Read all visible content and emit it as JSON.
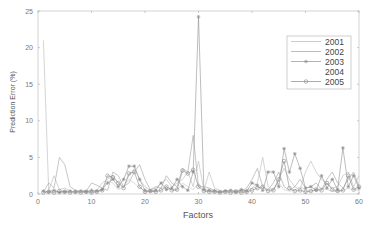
{
  "chart_data": {
    "type": "line",
    "title": "",
    "xlabel": "Factors",
    "ylabel": "Prediction Error (%)",
    "xlim": [
      0,
      60
    ],
    "ylim": [
      0,
      25
    ],
    "xticks": [
      0,
      10,
      20,
      30,
      40,
      50,
      60
    ],
    "yticks": [
      0,
      5,
      10,
      15,
      20,
      25
    ],
    "grid": false,
    "legend_position": "upper right",
    "x": [
      1,
      2,
      3,
      4,
      5,
      6,
      7,
      8,
      9,
      10,
      11,
      12,
      13,
      14,
      15,
      16,
      17,
      18,
      19,
      20,
      21,
      22,
      23,
      24,
      25,
      26,
      27,
      28,
      29,
      30,
      31,
      32,
      33,
      34,
      35,
      36,
      37,
      38,
      39,
      40,
      41,
      42,
      43,
      44,
      45,
      46,
      47,
      48,
      49,
      50,
      51,
      52,
      53,
      54,
      55,
      56,
      57,
      58,
      59,
      60
    ],
    "series": [
      {
        "name": "2001",
        "color": "#b8b8b8",
        "marker": "none",
        "values": [
          21,
          0.5,
          2.5,
          0.6,
          0.8,
          0.4,
          0.3,
          0.5,
          0.4,
          0.3,
          0.5,
          1.5,
          2.0,
          2.5,
          1.5,
          1.0,
          2.5,
          3.5,
          2.0,
          1.0,
          0.5,
          0.8,
          1.5,
          2.0,
          1.0,
          1.5,
          2.0,
          3.0,
          1.0,
          4.5,
          0.5,
          3.0,
          0.8,
          0.5,
          0.3,
          0.4,
          0.6,
          0.4,
          0.5,
          0.8,
          1.5,
          5.0,
          1.0,
          0.5,
          2.0,
          3.5,
          2.0,
          1.0,
          0.6,
          3.0,
          4.5,
          3.0,
          2.0,
          1.5,
          0.8,
          1.0,
          2.5,
          3.0,
          1.0,
          2.5
        ]
      },
      {
        "name": "2002",
        "color": "#a0a0a0",
        "marker": "none",
        "values": [
          0.3,
          1.5,
          0.8,
          5.0,
          4.0,
          1.0,
          0.5,
          0.3,
          0.4,
          1.5,
          1.2,
          0.8,
          0.5,
          3.0,
          2.5,
          1.0,
          1.5,
          3.0,
          4.0,
          2.0,
          0.6,
          1.0,
          0.8,
          2.5,
          1.5,
          1.0,
          3.5,
          3.0,
          8.0,
          1.0,
          1.0,
          0.8,
          0.5,
          0.3,
          0.4,
          0.5,
          0.3,
          0.4,
          0.8,
          2.0,
          3.5,
          1.0,
          0.6,
          1.5,
          3.0,
          1.0,
          0.5,
          1.0,
          2.0,
          0.8,
          1.0,
          1.5,
          0.6,
          2.0,
          3.0,
          1.5,
          0.8,
          2.0,
          3.0,
          1.0
        ]
      },
      {
        "name": "2003",
        "color": "#909090",
        "marker": "star",
        "values": [
          0.4,
          0.3,
          0.5,
          0.2,
          0.3,
          0.4,
          0.3,
          0.4,
          0.3,
          0.5,
          0.4,
          0.6,
          1.5,
          2.0,
          1.0,
          2.0,
          3.8,
          3.8,
          2.0,
          0.5,
          0.4,
          0.5,
          1.5,
          0.6,
          0.8,
          2.0,
          1.0,
          0.5,
          3.0,
          24.2,
          0.6,
          0.5,
          0.4,
          0.3,
          0.4,
          0.5,
          0.3,
          0.6,
          0.4,
          1.5,
          1.2,
          0.5,
          3.0,
          3.0,
          1.0,
          6.2,
          3.0,
          5.5,
          3.5,
          0.8,
          1.0,
          0.5,
          2.5,
          0.8,
          2.0,
          0.6,
          6.3,
          1.0,
          2.5,
          0.8
        ]
      },
      {
        "name": "2004",
        "color": "#c4c4c4",
        "marker": "none",
        "values": [
          0.3,
          0.4,
          0.6,
          0.3,
          0.5,
          0.3,
          0.4,
          0.3,
          0.5,
          0.4,
          0.3,
          0.8,
          1.8,
          1.5,
          0.6,
          1.0,
          2.0,
          1.5,
          0.8,
          0.5,
          0.4,
          0.3,
          0.8,
          1.0,
          0.6,
          0.5,
          1.5,
          1.0,
          0.6,
          1.5,
          0.5,
          0.4,
          0.3,
          0.4,
          0.3,
          0.5,
          0.4,
          0.3,
          0.4,
          0.8,
          1.0,
          0.6,
          0.5,
          0.8,
          1.5,
          0.6,
          0.4,
          0.5,
          1.0,
          0.6,
          0.4,
          0.5,
          0.8,
          0.6,
          0.4,
          0.3,
          0.5,
          0.8,
          0.6,
          0.5
        ]
      },
      {
        "name": "2005",
        "color": "#8a8a8a",
        "marker": "circle",
        "values": [
          0.2,
          0.3,
          0.2,
          0.4,
          0.3,
          0.2,
          0.3,
          0.2,
          0.3,
          0.2,
          0.3,
          0.5,
          2.5,
          2.3,
          1.5,
          0.8,
          2.8,
          3.0,
          1.0,
          0.3,
          0.4,
          0.3,
          0.5,
          1.0,
          0.5,
          0.6,
          3.2,
          2.8,
          3.3,
          1.0,
          0.4,
          0.3,
          0.3,
          0.2,
          0.3,
          0.2,
          0.3,
          0.2,
          0.3,
          0.5,
          0.8,
          1.0,
          0.4,
          0.5,
          2.0,
          4.5,
          0.8,
          0.4,
          0.5,
          0.3,
          0.4,
          0.6,
          0.5,
          1.5,
          0.6,
          0.4,
          0.5,
          2.5,
          0.6,
          1.0
        ]
      }
    ]
  },
  "caption_fragment": ". . . . . . . . . . . . . . . . . . . ."
}
